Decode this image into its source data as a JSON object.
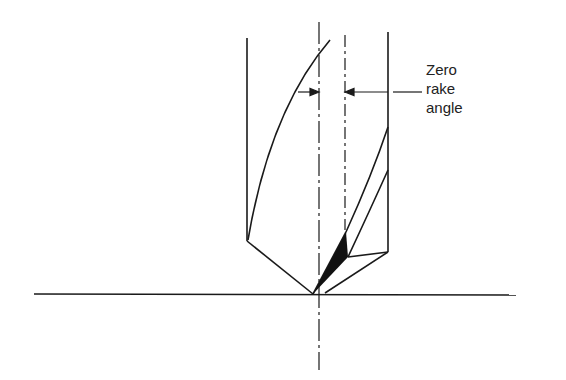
{
  "diagram": {
    "type": "drill-point-geometry",
    "annotation": {
      "lines": [
        "Zero",
        "rake",
        "angle"
      ]
    },
    "colors": {
      "stroke": "#1a1a1a",
      "background": "#ffffff",
      "fill": "#111111"
    }
  }
}
